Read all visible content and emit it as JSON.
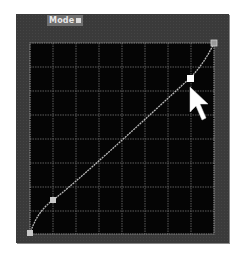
{
  "panel": {
    "title": "Mode",
    "colors": {
      "panel_bg": "#3a3a3a",
      "grid_bg": "#050505",
      "grid_line": "#5c5c5c",
      "grid_border": "#8c8c8c",
      "curve": "#b8b8b8",
      "point": "#c8c8c8",
      "selected_point": "#ffffff",
      "cursor": "#ffffff"
    },
    "grid": {
      "columns": 8,
      "rows": 8
    },
    "curve_points": [
      {
        "name": "black-point",
        "x": 0,
        "y": 0
      },
      {
        "name": "shadow-point",
        "x": 12,
        "y": 18
      },
      {
        "name": "highlight-point",
        "x": 87,
        "y": 81
      },
      {
        "name": "white-point",
        "x": 100,
        "y": 100
      }
    ],
    "selected_point": "highlight-point"
  }
}
